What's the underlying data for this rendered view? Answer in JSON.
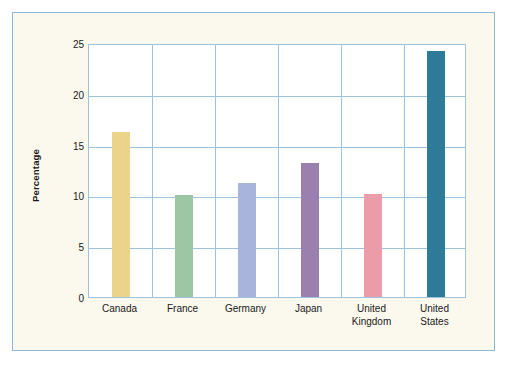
{
  "chart_data": {
    "type": "bar",
    "title": "",
    "xlabel": "",
    "ylabel": "Percentage",
    "categories": [
      "Canada",
      "France",
      "Germany",
      "Japan",
      "United Kingdom",
      "United States"
    ],
    "values": [
      16.2,
      10.0,
      11.2,
      13.2,
      10.1,
      24.2
    ],
    "ylim": [
      0,
      25
    ],
    "yticks": [
      0,
      5,
      10,
      15,
      20,
      25
    ],
    "ytick_labels": [
      "0",
      "5",
      "10",
      "15",
      "20",
      "25"
    ],
    "grid": "horizontal-and-vertical",
    "legend": "none",
    "bar_colors": [
      "#ebd38a",
      "#9cc6a4",
      "#a8b4dc",
      "#9b7fae",
      "#ec9ba9",
      "#2e7b99"
    ]
  },
  "figure": {
    "background_color": "#fbf8ee",
    "border_color": "#8fb8d8",
    "plot_background_color": "#ffffff",
    "grid_color": "#9dc3e0",
    "axis_text_color": "#1a1a1a"
  },
  "axis": {
    "y_title": "Percentage",
    "y_tick_0": "0",
    "y_tick_1": "5",
    "y_tick_2": "10",
    "y_tick_3": "15",
    "y_tick_4": "20",
    "y_tick_5": "25"
  },
  "x_labels": {
    "canada": "Canada",
    "france": "France",
    "germany": "Germany",
    "japan": "Japan",
    "united_kingdom_line1": "United",
    "united_kingdom_line2": "Kingdom",
    "united_states_line1": "United",
    "united_states_line2": "States"
  }
}
